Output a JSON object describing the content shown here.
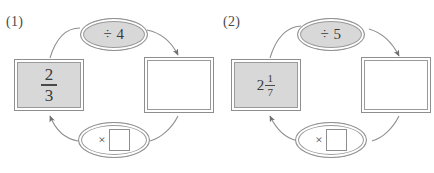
{
  "page": {
    "type": "math-worksheet-flow-diagrams",
    "colors": {
      "fill_gray": "#d8d8d8",
      "stroke_gray": "#8e8e8e",
      "text": "#3a3a3a",
      "white": "#ffffff"
    }
  },
  "diagrams": [
    {
      "index_label": "(1)",
      "start_box": {
        "value_type": "fraction",
        "whole": "",
        "numerator": "2",
        "denominator": "3",
        "filled": true
      },
      "result_box": {
        "value": "",
        "filled": false
      },
      "top_operation": {
        "symbol": "÷",
        "operand": "4",
        "text": "÷ 4",
        "filled": true
      },
      "bottom_operation": {
        "symbol": "×",
        "operand": "",
        "has_blank_box": true,
        "filled": false
      },
      "arrow_top_direction": "left-to-right",
      "arrow_bottom_direction": "right-to-left"
    },
    {
      "index_label": "(2)",
      "start_box": {
        "value_type": "mixed-number",
        "whole": "2",
        "numerator": "1",
        "denominator": "7",
        "filled": true
      },
      "result_box": {
        "value": "",
        "filled": false
      },
      "top_operation": {
        "symbol": "÷",
        "operand": "5",
        "text": "÷ 5",
        "filled": true
      },
      "bottom_operation": {
        "symbol": "×",
        "operand": "",
        "has_blank_box": true,
        "filled": false
      },
      "arrow_top_direction": "left-to-right",
      "arrow_bottom_direction": "right-to-left"
    }
  ]
}
